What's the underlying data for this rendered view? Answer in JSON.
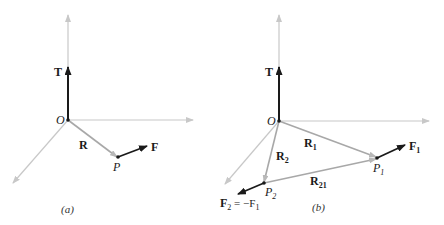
{
  "colors": {
    "axis": "#c8c8c8",
    "position_vector": "#a8a8a8",
    "force_vector": "#1a1a1a",
    "label": "#1a1a1a"
  },
  "panels": [
    {
      "id": "a",
      "caption": "(a)",
      "origin_label": "O",
      "torque_label": "T",
      "position_label": "R",
      "point_label": "P",
      "force_label": "F"
    },
    {
      "id": "b",
      "caption": "(b)",
      "origin_label": "O",
      "torque_label": "T",
      "r1_label": "R",
      "r1_sub": "1",
      "r2_label": "R",
      "r2_sub": "2",
      "r21_label": "R",
      "r21_sub": "21",
      "p1_label": "P",
      "p1_sub": "1",
      "p2_label": "P",
      "p2_sub": "2",
      "f1_label": "F",
      "f1_sub": "1",
      "f2_label": "F",
      "f2_sub": "2",
      "f2_equation": " = −F",
      "f2_equation_sub": "1"
    }
  ]
}
